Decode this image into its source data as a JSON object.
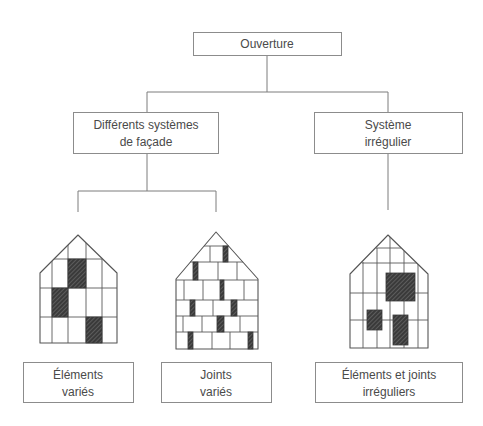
{
  "diagram": {
    "root": {
      "lines": [
        "Ouverture"
      ]
    },
    "branches": [
      {
        "lines": [
          "Différents systèmes",
          "de façade"
        ],
        "children": [
          {
            "lines": [
              "Éléments",
              "variés"
            ],
            "illustration": "house-varied-elements"
          },
          {
            "lines": [
              "Joints",
              "variés"
            ],
            "illustration": "house-varied-joints"
          }
        ]
      },
      {
        "lines": [
          "Système",
          "irrégulier"
        ],
        "children": [
          {
            "lines": [
              "Éléments et joints",
              "irréguliers"
            ],
            "illustration": "house-irregular-elements-joints"
          }
        ]
      }
    ]
  },
  "colors": {
    "background": "#ffffff",
    "box_border": "#8c8c8c",
    "connector": "#7d7d7d",
    "text": "#4a4a4a",
    "drawing_line": "#555555",
    "hatched_fill": "#3a3a3a"
  }
}
